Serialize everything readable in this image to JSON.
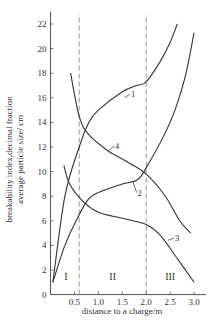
{
  "chart_data": {
    "type": "line",
    "title": "",
    "xlabel": "distance to a charge/m",
    "ylabel_lines": [
      "breakability index,decimal fraction",
      "average particle size/ cm"
    ],
    "xlim": [
      0,
      3.25
    ],
    "ylim": [
      0,
      23
    ],
    "x_ticks": [
      0.5,
      1.0,
      1.5,
      2.0,
      2.5,
      3.0
    ],
    "x_tick_labels": [
      "0.5",
      "1.0",
      "1.5",
      "2.0",
      "2.5",
      "3.0"
    ],
    "y_ticks": [
      0,
      2,
      4,
      6,
      8,
      10,
      12,
      14,
      16,
      18,
      20,
      22
    ],
    "y_tick_labels": [
      "0",
      "2",
      "4",
      "6",
      "8",
      "10",
      "12",
      "14",
      "16",
      "18",
      "20",
      "22"
    ],
    "grid": false,
    "legend": "inline curve numbers",
    "zone_boundaries": [
      0.6,
      2.0
    ],
    "zones": [
      {
        "label": "I",
        "x": 0.32,
        "y": 1.5
      },
      {
        "label": "II",
        "x": 1.3,
        "y": 1.5
      },
      {
        "label": "III",
        "x": 2.5,
        "y": 1.5
      }
    ],
    "series": [
      {
        "name": "1",
        "label_at": {
          "x": 1.55,
          "y": 16.0,
          "lx": 1.68,
          "ly": 16.3
        },
        "x": [
          0.05,
          0.3,
          0.6,
          0.8,
          1.0,
          1.5,
          1.8,
          2.0,
          2.3,
          2.5,
          2.65
        ],
        "y": [
          1.0,
          8.0,
          12.0,
          14.0,
          15.0,
          16.5,
          17.0,
          17.3,
          19.0,
          20.5,
          22.0
        ]
      },
      {
        "name": "2",
        "label_at": {
          "x": 1.72,
          "y": 9.2,
          "lx": 1.82,
          "ly": 8.3
        },
        "x": [
          0.05,
          0.3,
          0.6,
          0.8,
          1.0,
          1.5,
          1.8,
          2.0,
          2.5,
          2.8,
          3.0
        ],
        "y": [
          1.0,
          4.0,
          6.5,
          7.8,
          8.3,
          9.0,
          9.3,
          10.3,
          14.0,
          17.5,
          21.3
        ]
      },
      {
        "name": "3",
        "label_at": {
          "x": 2.45,
          "y": 4.4,
          "lx": 2.6,
          "ly": 4.6
        },
        "x": [
          0.28,
          0.4,
          0.7,
          1.0,
          1.5,
          2.0,
          2.3,
          2.6,
          3.0
        ],
        "y": [
          10.5,
          9.0,
          7.5,
          6.7,
          6.2,
          5.7,
          4.8,
          3.2,
          1.0
        ]
      },
      {
        "name": "4",
        "label_at": {
          "x": 1.22,
          "y": 11.7,
          "lx": 1.35,
          "ly": 12.1
        },
        "x": [
          0.42,
          0.6,
          0.8,
          1.2,
          1.6,
          2.0,
          2.4,
          2.7,
          2.93
        ],
        "y": [
          18.0,
          14.5,
          13.0,
          11.7,
          10.8,
          9.8,
          8.0,
          6.0,
          5.0
        ]
      }
    ],
    "colors": {
      "line": "#333333",
      "axis": "#555555",
      "dash": "#888888"
    }
  }
}
